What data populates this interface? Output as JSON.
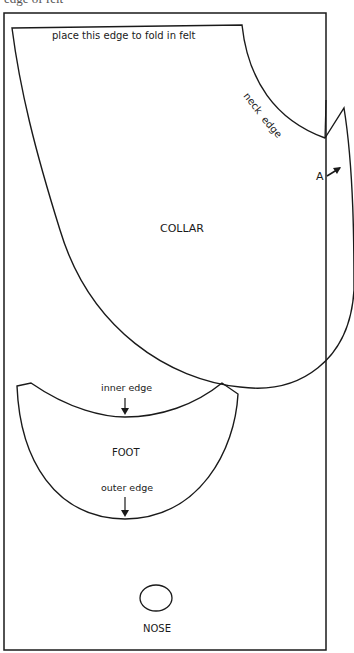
{
  "top_cut_text": "edge of felt",
  "collar": {
    "title": "COLLAR",
    "fold_label": "place this edge to fold in felt",
    "neck_label_1": "neck",
    "neck_label_2": "edge",
    "point_label": "A"
  },
  "foot": {
    "title": "FOOT",
    "inner_label": "inner edge",
    "outer_label": "outer edge"
  },
  "nose": {
    "title": "NOSE"
  },
  "colors": {
    "line": "#1a1a1a",
    "background": "#ffffff"
  }
}
